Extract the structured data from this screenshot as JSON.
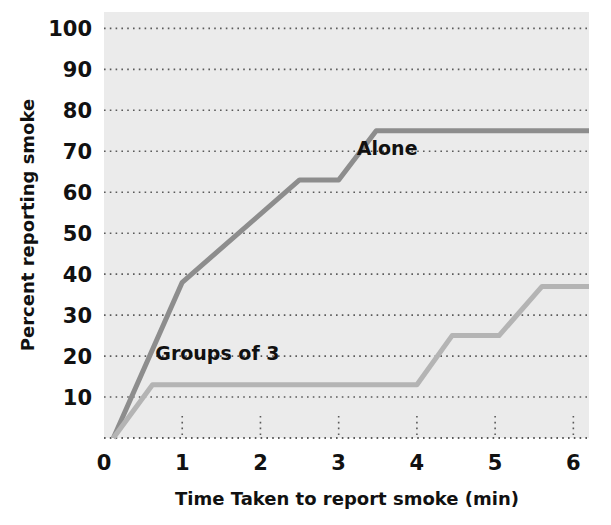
{
  "chart_data": {
    "type": "line",
    "title": "",
    "subtitle": "",
    "xlabel": "Time Taken to report smoke (min)",
    "ylabel": "Percent reporting smoke",
    "xlim": [
      0,
      6.2
    ],
    "ylim": [
      0,
      104
    ],
    "x_ticks": [
      0,
      1,
      2,
      3,
      4,
      5,
      6
    ],
    "x_tick_labels": [
      "0",
      "1",
      "2",
      "3",
      "4",
      "5",
      "6"
    ],
    "y_ticks": [
      10,
      20,
      30,
      40,
      50,
      60,
      70,
      80,
      90,
      100
    ],
    "y_tick_labels": [
      "10",
      "20",
      "30",
      "40",
      "50",
      "60",
      "70",
      "80",
      "90",
      "100"
    ],
    "grid": "dotted-horizontal-and-minor-vertical",
    "legend_position": "inline-annotations",
    "plot_background": "#ebebeb",
    "series": [
      {
        "name": "Alone",
        "color": "#8d8d8d",
        "label_x": 3.62,
        "label_y": 69,
        "points": [
          {
            "x": 0.12,
            "y": 0
          },
          {
            "x": 1.0,
            "y": 38
          },
          {
            "x": 2.5,
            "y": 63
          },
          {
            "x": 3.0,
            "y": 63
          },
          {
            "x": 3.48,
            "y": 75
          },
          {
            "x": 6.2,
            "y": 75
          }
        ]
      },
      {
        "name": "Groups of 3",
        "color": "#b4b4b4",
        "label_x": 1.45,
        "label_y": 19,
        "points": [
          {
            "x": 0.12,
            "y": 0
          },
          {
            "x": 0.62,
            "y": 13
          },
          {
            "x": 4.0,
            "y": 13
          },
          {
            "x": 4.45,
            "y": 25
          },
          {
            "x": 5.05,
            "y": 25
          },
          {
            "x": 5.6,
            "y": 37
          },
          {
            "x": 6.2,
            "y": 37
          }
        ]
      }
    ]
  },
  "layout": {
    "plot_left": 104,
    "plot_right": 589,
    "plot_top": 12,
    "plot_bottom": 438,
    "grid_color": "#5a5a5a",
    "axis_color": "#5a5a5a"
  }
}
